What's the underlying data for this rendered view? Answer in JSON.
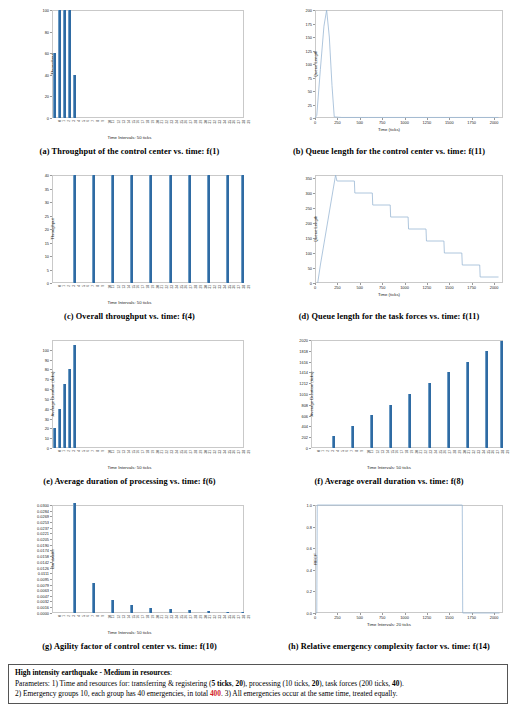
{
  "figure": {
    "panels": [
      {
        "key": "a",
        "label": "(a)",
        "caption": "Throughput of the control center vs. time: f(1)",
        "chart_data": {
          "type": "bar",
          "title": "",
          "xlabel": "Time Intervals: 50 ticks",
          "ylabel": "Throughput",
          "ylim": [
            0,
            100
          ],
          "yticks": [
            0,
            20,
            40,
            60,
            80,
            100
          ],
          "categories": [
            "0",
            "1",
            "2",
            "3",
            "4",
            "5",
            "6",
            "7",
            "8",
            "9",
            "10",
            "11",
            "12",
            "13",
            "14",
            "15",
            "16",
            "17",
            "18",
            "19",
            "20",
            "21",
            "22",
            "23",
            "24",
            "25",
            "26",
            "27",
            "28",
            "29",
            "30",
            "31",
            "32",
            "33",
            "34",
            "35",
            "36",
            "37",
            "38",
            "39"
          ],
          "values": [
            60,
            100,
            100,
            100,
            40,
            0,
            0,
            0,
            0,
            0,
            0,
            0,
            0,
            0,
            0,
            0,
            0,
            0,
            0,
            0,
            0,
            0,
            0,
            0,
            0,
            0,
            0,
            0,
            0,
            0,
            0,
            0,
            0,
            0,
            0,
            0,
            0,
            0,
            0,
            0
          ],
          "grid": false,
          "legend": "none"
        }
      },
      {
        "key": "b",
        "label": "(b)",
        "caption": "Queue length for the control center vs. time: f(11)",
        "chart_data": {
          "type": "line",
          "title": "",
          "xlabel": "Time (ticks)",
          "ylabel": "Queue Length",
          "xlim": [
            0,
            2100
          ],
          "ylim": [
            0,
            200
          ],
          "xticks": [
            0,
            250,
            500,
            750,
            1000,
            1250,
            1500,
            1750,
            2000
          ],
          "yticks": [
            0,
            25,
            50,
            75,
            100,
            125,
            150,
            175,
            200
          ],
          "x": [
            0,
            20,
            60,
            100,
            130,
            160,
            190,
            215,
            300,
            600,
            1000,
            1400,
            1800,
            2050
          ],
          "y": [
            0,
            5,
            90,
            170,
            200,
            150,
            60,
            2,
            1,
            1,
            1,
            1,
            1,
            1
          ],
          "grid": false,
          "legend": "none"
        }
      },
      {
        "key": "c",
        "label": "(c)",
        "caption": "Overall throughput vs. time: f(4)",
        "chart_data": {
          "type": "bar",
          "title": "",
          "xlabel": "Time Intervals: 50 ticks",
          "ylabel": "Throughput",
          "ylim": [
            0,
            40
          ],
          "yticks": [
            0,
            5,
            10,
            15,
            20,
            25,
            30,
            35,
            40
          ],
          "categories": [
            "0",
            "1",
            "2",
            "3",
            "4",
            "5",
            "6",
            "7",
            "8",
            "9",
            "10",
            "11",
            "12",
            "13",
            "14",
            "15",
            "16",
            "17",
            "18",
            "19",
            "20",
            "21",
            "22",
            "23",
            "24",
            "25",
            "26",
            "27",
            "28",
            "29",
            "30",
            "31",
            "32",
            "33",
            "34",
            "35",
            "36",
            "37",
            "38",
            "39"
          ],
          "values": [
            0,
            0,
            0,
            0,
            40,
            0,
            0,
            0,
            40,
            0,
            0,
            0,
            40,
            0,
            0,
            0,
            40,
            0,
            0,
            0,
            40,
            0,
            0,
            0,
            40,
            0,
            0,
            0,
            40,
            0,
            0,
            0,
            40,
            0,
            0,
            0,
            40,
            0,
            0,
            40
          ],
          "grid": false,
          "legend": "none"
        }
      },
      {
        "key": "d",
        "label": "(d)",
        "caption": "Queue length for the task forces vs. time: f(11)",
        "chart_data": {
          "type": "line",
          "title": "",
          "xlabel": "Time (ticks)",
          "ylabel": "Queue Length",
          "xlim": [
            0,
            2100
          ],
          "ylim": [
            0,
            360
          ],
          "xticks": [
            0,
            250,
            500,
            750,
            1000,
            1250,
            1500,
            1750,
            2000
          ],
          "yticks": [
            0,
            50,
            100,
            150,
            200,
            250,
            300,
            350
          ],
          "x": [
            30,
            60,
            230,
            245,
            250,
            440,
            445,
            640,
            645,
            840,
            845,
            1040,
            1045,
            1240,
            1245,
            1440,
            1445,
            1640,
            1645,
            1840,
            1845,
            2050
          ],
          "y": [
            0,
            60,
            360,
            340,
            340,
            340,
            300,
            300,
            260,
            260,
            220,
            220,
            180,
            180,
            140,
            140,
            100,
            100,
            60,
            60,
            20,
            20
          ],
          "grid": false,
          "legend": "none"
        }
      },
      {
        "key": "e",
        "label": "(e)",
        "caption": "Average duration of processing vs. time: f(6)",
        "chart_data": {
          "type": "bar",
          "title": "",
          "xlabel": "Time Intervals: 50 ticks",
          "ylabel": "Average Duration (ticks)",
          "ylim": [
            0,
            110
          ],
          "yticks": [
            0,
            10,
            20,
            30,
            40,
            50,
            60,
            70,
            80,
            90,
            100
          ],
          "categories": [
            "0",
            "1",
            "2",
            "3",
            "4",
            "5",
            "6",
            "7",
            "8",
            "9",
            "10",
            "11",
            "12",
            "13",
            "14",
            "15",
            "16",
            "17",
            "18",
            "19",
            "20",
            "21",
            "22",
            "23",
            "24",
            "25",
            "26",
            "27",
            "28",
            "29",
            "30",
            "31",
            "32",
            "33",
            "34",
            "35",
            "36",
            "37",
            "38",
            "39"
          ],
          "values": [
            20,
            40,
            65,
            80,
            105,
            0,
            0,
            0,
            0,
            0,
            0,
            0,
            0,
            0,
            0,
            0,
            0,
            0,
            0,
            0,
            0,
            0,
            0,
            0,
            0,
            0,
            0,
            0,
            0,
            0,
            0,
            0,
            0,
            0,
            0,
            0,
            0,
            0,
            0,
            0
          ],
          "grid": false,
          "legend": "none"
        }
      },
      {
        "key": "f",
        "label": "(f)",
        "caption": "Average overall duration vs. time: f(8)",
        "chart_data": {
          "type": "bar",
          "title": "",
          "xlabel": "Time Intervals: 50 ticks",
          "ylabel": "Average Duration (ticks)",
          "ylim": [
            0,
            2020
          ],
          "yticks": [
            0,
            202,
            404,
            606,
            808,
            1010,
            1212,
            1414,
            1616,
            1818,
            2020
          ],
          "categories": [
            "0",
            "1",
            "2",
            "3",
            "4",
            "5",
            "6",
            "7",
            "8",
            "9",
            "10",
            "11",
            "12",
            "13",
            "14",
            "15",
            "16",
            "17",
            "18",
            "19",
            "20",
            "21",
            "22",
            "23",
            "24",
            "25",
            "26",
            "27",
            "28",
            "29",
            "30",
            "31",
            "32",
            "33",
            "34",
            "35",
            "36",
            "37",
            "38",
            "39"
          ],
          "values": [
            0,
            0,
            0,
            0,
            220,
            0,
            0,
            0,
            420,
            0,
            0,
            0,
            620,
            0,
            0,
            0,
            810,
            0,
            0,
            0,
            1015,
            0,
            0,
            0,
            1215,
            0,
            0,
            0,
            1420,
            0,
            0,
            0,
            1615,
            0,
            0,
            0,
            1815,
            0,
            0,
            2010
          ],
          "grid": false,
          "legend": "none"
        }
      },
      {
        "key": "g",
        "label": "(g)",
        "caption": "Agility factor of control center vs. time: f(10)",
        "chart_data": {
          "type": "bar",
          "title": "",
          "xlabel": "Time Intervals: 50 ticks",
          "ylabel": "Bandwidth",
          "ylim": [
            0,
            0.03
          ],
          "yticks": [
            0.0,
            0.0016,
            0.0032,
            0.0047,
            0.0063,
            0.0079,
            0.0095,
            0.0111,
            0.0126,
            0.0142,
            0.0158,
            0.0174,
            0.019,
            0.0205,
            0.0221,
            0.0237,
            0.0253,
            0.0269,
            0.0284,
            0.03
          ],
          "yticklabels": [
            "0.0000",
            "0.0016",
            "0.0032",
            "0.0047",
            "0.0063",
            "0.0079",
            "0.0095",
            "0.0111",
            "0.0126",
            "0.0142",
            "0.0158",
            "0.0174",
            "0.0190",
            "0.0205",
            "0.0221",
            "0.0237",
            "0.0253",
            "0.0269",
            "0.0284",
            "0.0300"
          ],
          "categories": [
            "0",
            "1",
            "2",
            "3",
            "4",
            "5",
            "6",
            "7",
            "8",
            "9",
            "10",
            "11",
            "12",
            "13",
            "14",
            "15",
            "16",
            "17",
            "18",
            "19",
            "20",
            "21",
            "22",
            "23",
            "24",
            "25",
            "26",
            "27",
            "28",
            "29",
            "30",
            "31",
            "32",
            "33",
            "34",
            "35",
            "36",
            "37",
            "38",
            "39"
          ],
          "values": [
            0,
            0,
            0,
            0,
            0.0305,
            0,
            0,
            0,
            0.0082,
            0,
            0,
            0,
            0.0037,
            0,
            0,
            0,
            0.0022,
            0,
            0,
            0,
            0.0014,
            0,
            0,
            0,
            0.001,
            0,
            0,
            0,
            0.0007,
            0,
            0,
            0,
            0.0005,
            0,
            0,
            0,
            0.0003,
            0,
            0,
            0.0002
          ],
          "grid": false,
          "legend": "none"
        }
      },
      {
        "key": "h",
        "label": "(h)",
        "caption": "Relative emergency complexity factor vs. time: f(14)",
        "chart_data": {
          "type": "line",
          "title": "",
          "xlabel": "Time Intervals: 20 ticks",
          "ylabel": "RECF",
          "xlim": [
            0,
            2100
          ],
          "ylim": [
            0,
            1.0
          ],
          "xticks": [
            0,
            250,
            500,
            750,
            1000,
            1250,
            1500,
            1750,
            2000
          ],
          "yticks": [
            0.0,
            0.2,
            0.4,
            0.6,
            0.8,
            1.0
          ],
          "yticklabels": [
            "0.0",
            "0.2",
            "0.4",
            "0.6",
            "0.8",
            "1.0"
          ],
          "x": [
            10,
            20,
            25,
            1640,
            1645,
            1650,
            2060
          ],
          "y": [
            0,
            0,
            1.0,
            1.0,
            1.0,
            0,
            0
          ],
          "grid": false,
          "legend": "none"
        }
      }
    ]
  },
  "footer": {
    "heading": "High intensity earthquake - Medium in resources",
    "heading_suffix": ":",
    "line2_a": "Parameters:  1) Time and resources for: transferring  & registering  (",
    "line2_b1": "5 ticks",
    "line2_b2": ", ",
    "line2_b3": "20",
    "line2_c": "), processing (10 ticks, ",
    "line2_d": "20",
    "line2_e": "), task forces (200 ticks, ",
    "line2_f": "40",
    "line2_g": ").",
    "line3_a": "2) Emergency  groups 10, each group has 40 emergencies,  in total ",
    "line3_total": "400",
    "line3_b": ". 3) All  emergencies  occur at the same time, treated equally."
  },
  "style": {
    "bar_color": "#2f6ba3",
    "line_color": "#9ab8d4",
    "axis_color": "#c9c9c9",
    "red_accent": "#d2232a"
  }
}
